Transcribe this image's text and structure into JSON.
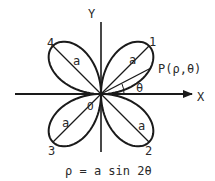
{
  "diagram": {
    "equation": "ρ = a sin 2θ",
    "axes": {
      "x_label": "X",
      "y_label": "Y",
      "origin_label": "O"
    },
    "point_label": "P(ρ,θ)",
    "angle_label": "θ",
    "petal_numbers": [
      "1",
      "2",
      "3",
      "4"
    ],
    "radius_label": "a",
    "colors": {
      "stroke": "#1a1a1a",
      "text": "#2a2a2a",
      "background": "#ffffff"
    }
  }
}
